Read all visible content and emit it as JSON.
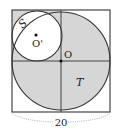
{
  "diagram": {
    "labels": {
      "region_s": "S",
      "region_t": "T",
      "center_o": "O",
      "center_o_prime": "O'",
      "side_length": "20"
    },
    "colors": {
      "shade": "#d6d6d6",
      "stroke": "#333333",
      "background": "#ffffff",
      "dimension_line": "#999999"
    }
  }
}
